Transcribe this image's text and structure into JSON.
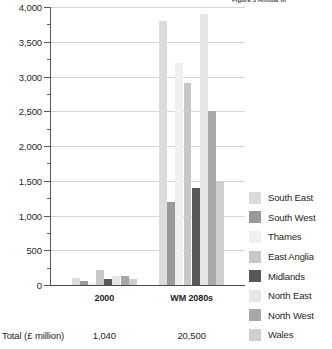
{
  "figure": {
    "caption_cropped": "Figure 3 Annual m"
  },
  "footer": {
    "total_label": "Total (£ million)",
    "totals": [
      "1,040",
      "20,500"
    ]
  },
  "legend": {
    "position": "right",
    "entries": [
      {
        "label": "South East",
        "color": "#dcdcdc"
      },
      {
        "label": "South West",
        "color": "#9a9a9a"
      },
      {
        "label": "Thames",
        "color": "#f0f0f0"
      },
      {
        "label": "East Anglia",
        "color": "#c8c8c8"
      },
      {
        "label": "Midlands",
        "color": "#585858"
      },
      {
        "label": "North East",
        "color": "#e6e6e6"
      },
      {
        "label": "North West",
        "color": "#a8a8a8"
      },
      {
        "label": "Wales",
        "color": "#cfcfcf"
      }
    ]
  },
  "chart_data": {
    "type": "bar",
    "title": "",
    "xlabel": "",
    "ylabel": "",
    "ylim": [
      0,
      4000
    ],
    "ytick_step": 500,
    "yminor_step": 250,
    "grid": true,
    "categories": [
      "2000",
      "WM 2080s"
    ],
    "ytick_labels": [
      "0",
      "500",
      "1,000",
      "1,500",
      "2,000",
      "2,500",
      "3,000",
      "3,500",
      "4,000"
    ],
    "ytick_values": [
      0,
      500,
      1000,
      1500,
      2000,
      2500,
      3000,
      3500,
      4000
    ],
    "series": [
      {
        "name": "South East",
        "color": "#dcdcdc",
        "values": [
          100,
          3800
        ]
      },
      {
        "name": "South West",
        "color": "#9a9a9a",
        "values": [
          55,
          1200
        ]
      },
      {
        "name": "Thames",
        "color": "#f0f0f0",
        "values": [
          30,
          3200
        ]
      },
      {
        "name": "East Anglia",
        "color": "#c8c8c8",
        "values": [
          220,
          2900
        ]
      },
      {
        "name": "Midlands",
        "color": "#585858",
        "values": [
          80,
          1400
        ]
      },
      {
        "name": "North East",
        "color": "#e6e6e6",
        "values": [
          125,
          3900
        ]
      },
      {
        "name": "North West",
        "color": "#a8a8a8",
        "values": [
          125,
          2500
        ]
      },
      {
        "name": "Wales",
        "color": "#cfcfcf",
        "values": [
          90,
          1500
        ]
      }
    ]
  }
}
